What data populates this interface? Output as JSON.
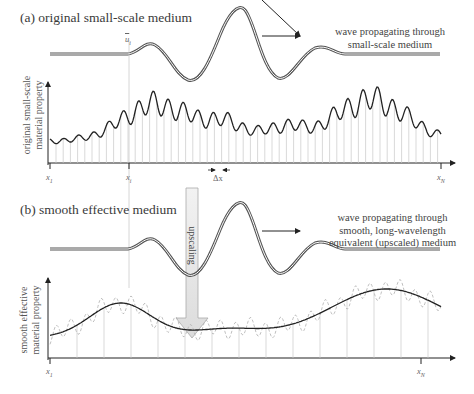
{
  "panel_a": {
    "title": "(a) original small-scale medium",
    "wave_note_line1": "wave propagating through",
    "wave_note_line2": "small-scale medium",
    "y_label_line1": "original small-scale",
    "y_label_line2": "material property",
    "x_ticks": {
      "first": "x",
      "first_sub": "1",
      "mid": "x",
      "mid_sub": "i",
      "last": "x",
      "last_sub": "N"
    },
    "wave_marker": "u",
    "wave_marker_sub": "i",
    "delta_label": "Δx"
  },
  "panel_b": {
    "title": "(b) smooth effective medium",
    "wave_note_line1": "wave propagating through",
    "wave_note_line2": "smooth, long-wavelength",
    "wave_note_line3": "equivalent (upscaled) medium",
    "y_label_line1": "smooth effective",
    "y_label_line2": "material property",
    "x_ticks": {
      "first": "x",
      "first_sub": "1",
      "last": "x",
      "last_sub": "N"
    }
  },
  "arrow": {
    "label": "upscaling"
  },
  "colors": {
    "curve": "#222222",
    "wave": "#666666",
    "grid": "#c8c8c8",
    "dashed": "#b0b0b0",
    "arrow_fill": "#e6e6e6"
  }
}
